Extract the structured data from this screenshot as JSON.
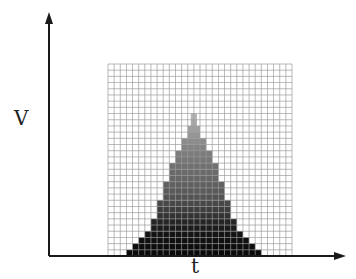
{
  "diagram": {
    "y_axis_label": "V",
    "x_axis_label": "t",
    "grid": {
      "left": 108,
      "top": 64,
      "right": 292,
      "bottom": 256,
      "cols": 30,
      "rows": 31,
      "line_color": "#9a9a9a"
    },
    "pyramid": {
      "center_col": 13.5,
      "steps": [
        {
          "row_from_bottom": 0,
          "half_width": 11,
          "color": "#0a0a0a"
        },
        {
          "row_from_bottom": 1,
          "half_width": 10,
          "color": "#0d0d0d"
        },
        {
          "row_from_bottom": 2,
          "half_width": 9,
          "color": "#101010"
        },
        {
          "row_from_bottom": 3,
          "half_width": 8,
          "color": "#141414"
        },
        {
          "row_from_bottom": 4,
          "half_width": 7,
          "color": "#1c1c1c"
        },
        {
          "row_from_bottom": 5,
          "half_width": 7,
          "color": "#262626"
        },
        {
          "row_from_bottom": 6,
          "half_width": 6,
          "color": "#333333"
        },
        {
          "row_from_bottom": 7,
          "half_width": 6,
          "color": "#3e3e3e"
        },
        {
          "row_from_bottom": 8,
          "half_width": 6,
          "color": "#484848"
        },
        {
          "row_from_bottom": 9,
          "half_width": 5,
          "color": "#535353"
        },
        {
          "row_from_bottom": 10,
          "half_width": 5,
          "color": "#5a5a5a"
        },
        {
          "row_from_bottom": 11,
          "half_width": 5,
          "color": "#606060"
        },
        {
          "row_from_bottom": 12,
          "half_width": 4,
          "color": "#666666"
        },
        {
          "row_from_bottom": 13,
          "half_width": 4,
          "color": "#6a6a6a"
        },
        {
          "row_from_bottom": 14,
          "half_width": 4,
          "color": "#707070"
        },
        {
          "row_from_bottom": 15,
          "half_width": 3,
          "color": "#767676"
        },
        {
          "row_from_bottom": 16,
          "half_width": 3,
          "color": "#7c7c7c"
        },
        {
          "row_from_bottom": 17,
          "half_width": 2,
          "color": "#848484"
        },
        {
          "row_from_bottom": 18,
          "half_width": 2,
          "color": "#8c8c8c"
        },
        {
          "row_from_bottom": 19,
          "half_width": 1,
          "color": "#959595"
        },
        {
          "row_from_bottom": 20,
          "half_width": 1,
          "color": "#a0a0a0"
        },
        {
          "row_from_bottom": 21,
          "half_width": 0.5,
          "color": "#aaaaaa"
        },
        {
          "row_from_bottom": 22,
          "half_width": 0.5,
          "color": "#b4b4b4"
        }
      ]
    },
    "axes": {
      "origin": [
        49,
        256
      ],
      "y_top": 12,
      "x_right": 346,
      "color": "#1a1a1a"
    }
  }
}
